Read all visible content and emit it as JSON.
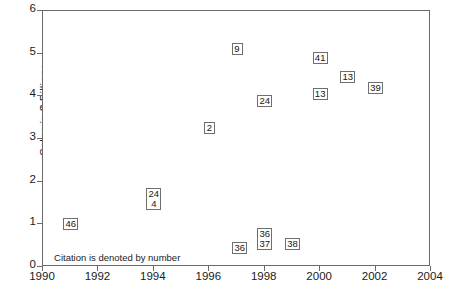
{
  "chart_data": {
    "type": "scatter",
    "title": "",
    "xlabel": "",
    "ylabel": "Sales in $ Billions",
    "xlim": [
      1990,
      2004
    ],
    "ylim": [
      0,
      6
    ],
    "xticks": [
      1990,
      1992,
      1994,
      1996,
      1998,
      2000,
      2002,
      2004
    ],
    "yticks": [
      0,
      1,
      2,
      3,
      4,
      5,
      6
    ],
    "grid": false,
    "legend": null,
    "annotations": [
      {
        "text": "Citation is denoted by number",
        "x": 1990.4,
        "y": 0.22
      }
    ],
    "point_label_meaning": "Citation is denoted by number",
    "points": [
      {
        "label": "46",
        "labels": [
          "46"
        ],
        "x": 1991.0,
        "y": 1.0
      },
      {
        "label": "24/4",
        "labels": [
          "24",
          "4"
        ],
        "x": 1994.0,
        "y": 1.6
      },
      {
        "label": "2",
        "labels": [
          "2"
        ],
        "x": 1996.0,
        "y": 3.25
      },
      {
        "label": "9",
        "labels": [
          "9"
        ],
        "x": 1997.0,
        "y": 5.1
      },
      {
        "label": "36",
        "labels": [
          "36"
        ],
        "x": 1997.1,
        "y": 0.45
      },
      {
        "label": "24",
        "labels": [
          "24"
        ],
        "x": 1998.0,
        "y": 3.9
      },
      {
        "label": "36/37",
        "labels": [
          "36",
          "37"
        ],
        "x": 1998.0,
        "y": 0.65
      },
      {
        "label": "38",
        "labels": [
          "38"
        ],
        "x": 1999.0,
        "y": 0.53
      },
      {
        "label": "41",
        "labels": [
          "41"
        ],
        "x": 2000.0,
        "y": 4.9
      },
      {
        "label": "13",
        "labels": [
          "13"
        ],
        "x": 2000.0,
        "y": 4.05
      },
      {
        "label": "13",
        "labels": [
          "13"
        ],
        "x": 2001.0,
        "y": 4.45
      },
      {
        "label": "39",
        "labels": [
          "39"
        ],
        "x": 2002.0,
        "y": 4.2
      }
    ]
  },
  "axis": {
    "ylabel": "Sales in $ Billions",
    "ytick_labels": [
      "0",
      "1",
      "2",
      "3",
      "4",
      "5",
      "6"
    ],
    "xtick_labels": [
      "1990",
      "1992",
      "1994",
      "1996",
      "1998",
      "2000",
      "2002",
      "2004"
    ]
  },
  "colors": {
    "frame": "#6a6a6a",
    "text": "#1a1a1a",
    "marker_border": "#6f6f6f",
    "background": "#ffffff"
  }
}
